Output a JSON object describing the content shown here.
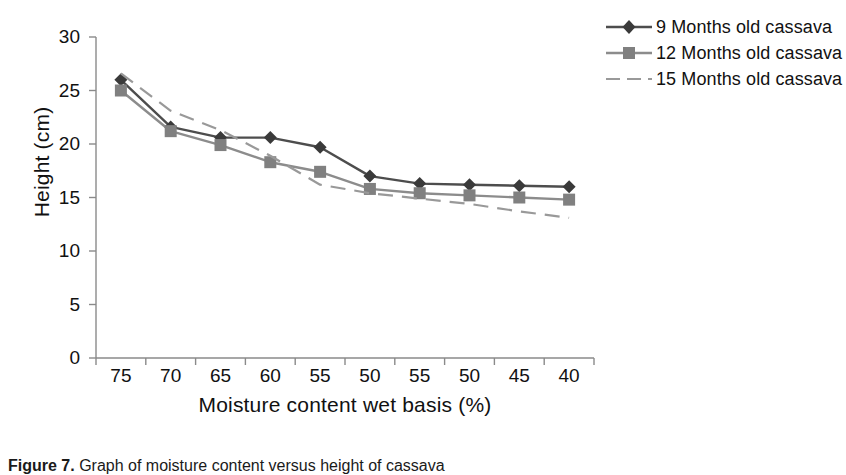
{
  "figure": {
    "caption_prefix": "Figure 7.",
    "caption_text": " Graph of moisture content versus height of cassava"
  },
  "chart_data": {
    "type": "line",
    "title": "",
    "xlabel": "Moisture content wet basis (%)",
    "ylabel": "Height (cm)",
    "categories": [
      "75",
      "70",
      "65",
      "60",
      "55",
      "50",
      "55",
      "50",
      "45",
      "40"
    ],
    "xlim": [
      0,
      9
    ],
    "ylim": [
      0,
      30
    ],
    "yticks": [
      "0",
      "5",
      "10",
      "15",
      "20",
      "25",
      "30"
    ],
    "grid": false,
    "legend_position": "right",
    "series": [
      {
        "name": "9 Months old cassava",
        "marker": "diamond",
        "line_style": "solid",
        "color": "#4d4d4d",
        "marker_color": "#3a3a3a",
        "values": [
          26.0,
          21.6,
          20.6,
          20.6,
          19.7,
          17.0,
          16.3,
          16.2,
          16.1,
          16.0
        ]
      },
      {
        "name": "12 Months old cassava",
        "marker": "square",
        "line_style": "solid",
        "color": "#8c8c8c",
        "marker_color": "#808080",
        "values": [
          25.0,
          21.2,
          19.9,
          18.3,
          17.4,
          15.8,
          15.4,
          15.2,
          15.0,
          14.8
        ]
      },
      {
        "name": "15 Months old cassava",
        "marker": "none",
        "line_style": "dashed",
        "color": "#999999",
        "marker_color": "#999999",
        "values": [
          26.6,
          23.1,
          21.3,
          18.9,
          16.2,
          15.4,
          14.9,
          14.4,
          13.7,
          13.1
        ]
      }
    ]
  },
  "axes": {
    "y_ticks": [
      {
        "label": "30",
        "value": 30
      },
      {
        "label": "25",
        "value": 25
      },
      {
        "label": "20",
        "value": 20
      },
      {
        "label": "15",
        "value": 15
      },
      {
        "label": "10",
        "value": 10
      },
      {
        "label": "5",
        "value": 5
      },
      {
        "label": "0",
        "value": 0
      }
    ],
    "x_ticks": [
      {
        "label": "75"
      },
      {
        "label": "70"
      },
      {
        "label": "65"
      },
      {
        "label": "60"
      },
      {
        "label": "55"
      },
      {
        "label": "50"
      },
      {
        "label": "55"
      },
      {
        "label": "50"
      },
      {
        "label": "45"
      },
      {
        "label": "40"
      }
    ]
  },
  "legend": {
    "items": [
      {
        "label": "9 Months old cassava"
      },
      {
        "label": "12 Months old cassava"
      },
      {
        "label": "15 Months old cassava"
      }
    ]
  }
}
